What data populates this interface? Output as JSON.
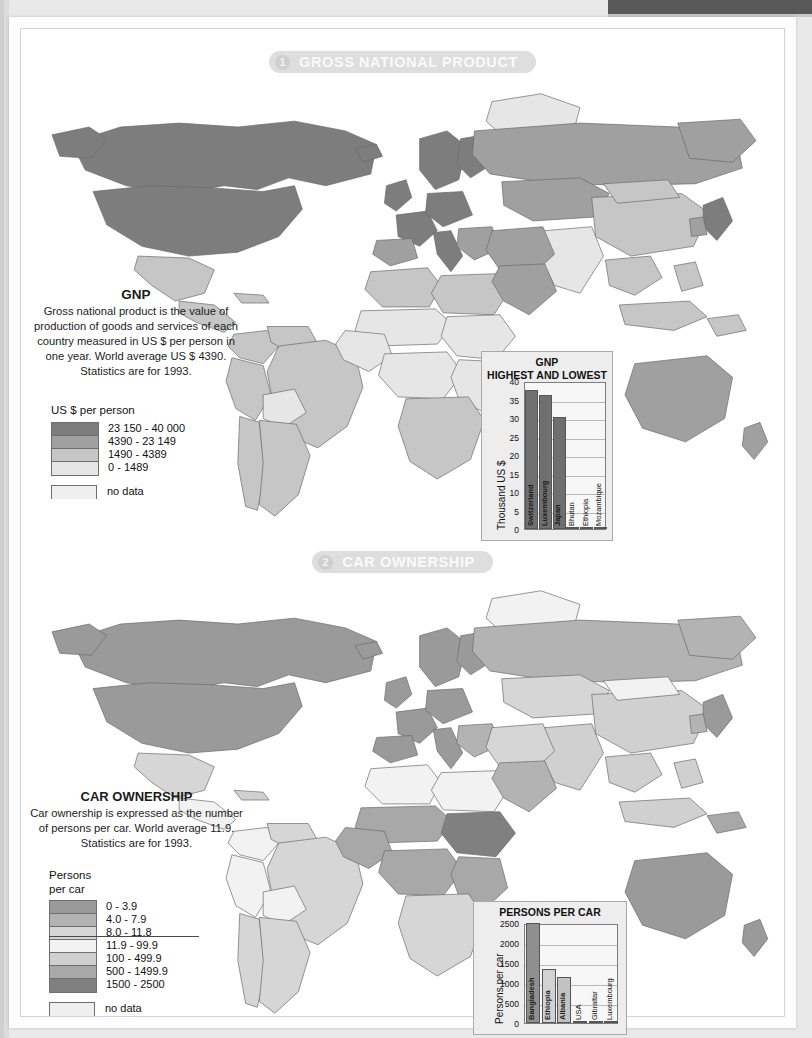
{
  "sections": [
    {
      "number": "1",
      "title": "GROSS NATIONAL PRODUCT",
      "text_title": "GNP",
      "text_body": "Gross national product is the value of production of goods and services of each country measured in US $ per person in one year. World average US $ 4390. Statistics are for 1993.",
      "legend_title": "US $ per person",
      "legend": [
        {
          "label": "23 150 - 40 000",
          "color": "#7d7d7d"
        },
        {
          "label": "4390 - 23 149",
          "color": "#a0a0a0"
        },
        {
          "label": "1490 - 4389",
          "color": "#c6c6c6"
        },
        {
          "label": "0 - 1489",
          "color": "#e6e6e6"
        }
      ],
      "nodata_label": "no data",
      "nodata_color": "#efefef"
    },
    {
      "number": "2",
      "title": "CAR OWNERSHIP",
      "text_title": "CAR OWNERSHIP",
      "text_body": "Car ownership is expressed as the number of persons per car. World average 11.9. Statistics are for 1993.",
      "legend_title": "Persons\nper car",
      "legend": [
        {
          "label": "0 - 3.9",
          "color": "#9a9a9a"
        },
        {
          "label": "4.0 - 7.9",
          "color": "#b3b3b3"
        },
        {
          "label": "8.0 - 11.8",
          "color": "#d6d6d6"
        },
        {
          "label": "11.9 - 99.9",
          "color": "#f2f2f2"
        },
        {
          "label": "100 - 499.9",
          "color": "#d0d0d0"
        },
        {
          "label": "500 - 1499.9",
          "color": "#a8a8a8"
        },
        {
          "label": "1500 - 2500",
          "color": "#808080"
        }
      ],
      "nodata_label": "no data",
      "nodata_color": "#efefef"
    }
  ],
  "chart_data": [
    {
      "type": "bar",
      "title": "GNP\nHIGHEST AND LOWEST",
      "title_line1": "GNP",
      "title_line2": "HIGHEST AND LOWEST",
      "xlabel": "",
      "ylabel": "Thousand US $",
      "categories": [
        "Switzerland",
        "Luxembourg",
        "Japan",
        "Bhutan",
        "Ethiopia",
        "Mozambique"
      ],
      "values": [
        37.5,
        36.3,
        30.3,
        0.17,
        0.1,
        0.09
      ],
      "ylim": [
        0,
        40
      ],
      "yticks": [
        0,
        5,
        10,
        15,
        20,
        25,
        30,
        35,
        40
      ],
      "grid": true,
      "legend": "none",
      "bar_colors": [
        "#6f6f6f",
        "#6f6f6f",
        "#6f6f6f",
        "#c9c9c9",
        "#c9c9c9",
        "#c9c9c9"
      ]
    },
    {
      "type": "bar",
      "title": "PERSONS PER CAR",
      "title_line1": "PERSONS PER CAR",
      "title_line2": "",
      "xlabel": "",
      "ylabel": "Persons per car",
      "categories": [
        "Bangladesh",
        "Ethiopia",
        "Albania",
        "USA",
        "Gibraltar",
        "Luxembourg"
      ],
      "values": [
        2500,
        1350,
        1150,
        55,
        40,
        30
      ],
      "ylim": [
        0,
        2500
      ],
      "yticks": [
        0,
        500,
        1000,
        1500,
        2000,
        2500
      ],
      "grid": true,
      "legend": "none",
      "bar_colors": [
        "#8f8f8f",
        "#d2d2d2",
        "#c2c2c2",
        "#9c9c9c",
        "#9c9c9c",
        "#9c9c9c"
      ]
    }
  ]
}
